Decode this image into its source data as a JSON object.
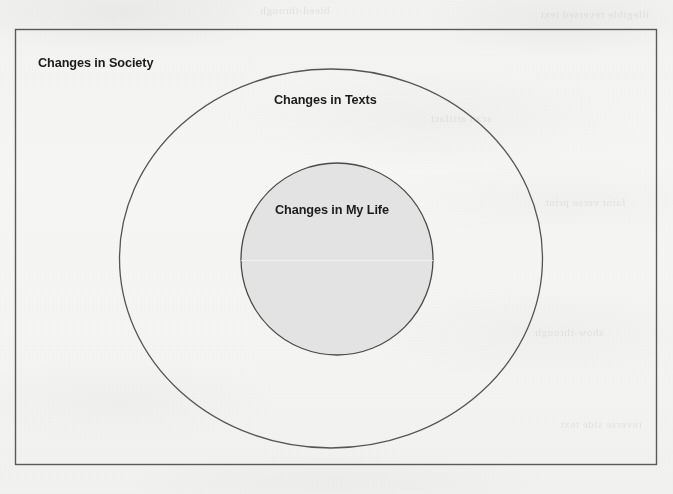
{
  "figure": {
    "type": "nested-venn-diagram",
    "background_color": "#f4f4f2",
    "outer_box": {
      "label": "Changes in Society",
      "x": 15,
      "y": 29,
      "width": 642,
      "height": 436,
      "stroke_color": "#5a5a5a",
      "fill_color": "none"
    },
    "ellipse": {
      "label": "Changes in Texts",
      "cx": 331,
      "cy": 258,
      "rx": 211,
      "ry": 189,
      "stroke_color": "#555555",
      "fill_color": "none"
    },
    "circle": {
      "label": "Changes in My Life",
      "cx": 337,
      "cy": 259,
      "r": 96,
      "stroke_color": "#4a4a4a",
      "fill_color": "#e3e3e3"
    },
    "labels": {
      "society": "Changes in Society",
      "texts": "Changes in Texts",
      "my_life": "Changes in My Life"
    },
    "ghost_text": {
      "row1": "bleed-through",
      "row2": "illegible reversed text",
      "row3": "scan artifact",
      "row4": "faint verso print",
      "row5": "show-through",
      "row6": "reverse side text"
    }
  }
}
